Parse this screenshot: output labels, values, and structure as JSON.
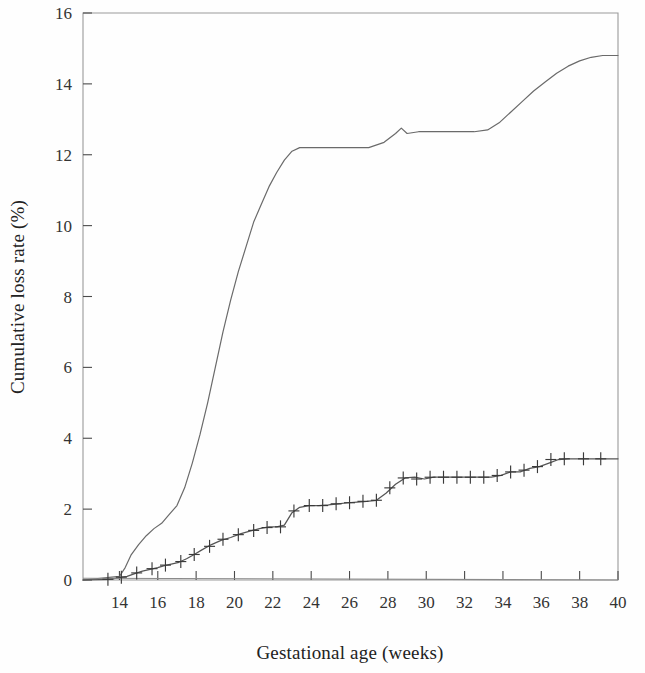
{
  "chart_data": {
    "type": "line",
    "title": "",
    "xlabel": "Gestational age (weeks)",
    "ylabel": "Cumulative loss rate (%)",
    "xlim": [
      12.1,
      40.0
    ],
    "ylim": [
      0,
      16
    ],
    "xticks": [
      14,
      16,
      18,
      20,
      22,
      24,
      26,
      28,
      30,
      32,
      34,
      36,
      38,
      40
    ],
    "yticks": [
      0,
      2,
      4,
      6,
      8,
      10,
      12,
      14,
      16
    ],
    "xtick_labels": [
      "14",
      "16",
      "18",
      "20",
      "22",
      "24",
      "26",
      "28",
      "30",
      "32",
      "34",
      "36",
      "38",
      "40"
    ],
    "ytick_labels": [
      "0",
      "2",
      "4",
      "6",
      "8",
      "10",
      "12",
      "14",
      "16"
    ],
    "grid": false,
    "legend": "none",
    "frame": "top-right-left-bottom-box",
    "series": [
      {
        "name": "upper-curve",
        "style": "plain-line",
        "color": "#6a6a6a",
        "x": [
          12.1,
          13.0,
          13.6,
          14.0,
          14.3,
          14.6,
          15.0,
          15.4,
          15.8,
          16.2,
          16.6,
          17.0,
          17.4,
          17.8,
          18.2,
          18.6,
          19.0,
          19.4,
          19.8,
          20.2,
          20.6,
          21.0,
          21.4,
          21.8,
          22.2,
          22.6,
          23.0,
          23.4,
          24.0,
          25.0,
          26.0,
          27.0,
          27.8,
          28.4,
          28.7,
          29.0,
          29.6,
          30.5,
          31.5,
          32.5,
          33.2,
          33.8,
          34.4,
          35.0,
          35.6,
          36.2,
          36.8,
          37.4,
          38.0,
          38.6,
          39.2,
          40.0
        ],
        "y": [
          0.0,
          0.05,
          0.08,
          0.1,
          0.35,
          0.7,
          1.0,
          1.25,
          1.45,
          1.6,
          1.85,
          2.1,
          2.6,
          3.3,
          4.1,
          5.0,
          6.0,
          7.0,
          7.9,
          8.7,
          9.4,
          10.1,
          10.6,
          11.1,
          11.5,
          11.85,
          12.1,
          12.2,
          12.2,
          12.2,
          12.2,
          12.2,
          12.35,
          12.6,
          12.75,
          12.6,
          12.65,
          12.65,
          12.65,
          12.65,
          12.7,
          12.9,
          13.2,
          13.5,
          13.8,
          14.05,
          14.3,
          14.5,
          14.65,
          14.75,
          14.8,
          14.8
        ]
      },
      {
        "name": "lower-curve",
        "style": "line-with-censor-marks",
        "color": "#555555",
        "x": [
          12.1,
          13.4,
          13.9,
          14.1,
          14.4,
          14.8,
          15.2,
          15.6,
          16.0,
          16.3,
          16.7,
          17.1,
          17.5,
          17.9,
          18.3,
          18.8,
          19.3,
          19.8,
          20.3,
          20.8,
          21.3,
          21.8,
          22.2,
          22.6,
          23.0,
          23.4,
          23.9,
          24.4,
          24.9,
          25.4,
          25.9,
          26.4,
          26.9,
          27.4,
          27.9,
          28.4,
          28.9,
          29.4,
          29.9,
          30.4,
          30.9,
          31.4,
          31.9,
          32.4,
          32.9,
          33.4,
          33.9,
          34.4,
          34.9,
          35.4,
          35.9,
          36.4,
          36.9,
          37.4,
          38.2,
          39.0,
          40.0
        ],
        "y": [
          0.0,
          0.02,
          0.05,
          0.08,
          0.1,
          0.18,
          0.25,
          0.3,
          0.35,
          0.4,
          0.45,
          0.5,
          0.6,
          0.72,
          0.85,
          1.0,
          1.12,
          1.2,
          1.3,
          1.38,
          1.45,
          1.5,
          1.5,
          1.55,
          1.9,
          2.05,
          2.1,
          2.1,
          2.12,
          2.15,
          2.18,
          2.2,
          2.22,
          2.25,
          2.45,
          2.7,
          2.88,
          2.9,
          2.85,
          2.9,
          2.9,
          2.9,
          2.9,
          2.9,
          2.9,
          2.9,
          2.95,
          3.05,
          3.05,
          3.15,
          3.2,
          3.3,
          3.4,
          3.42,
          3.42,
          3.42,
          3.42
        ]
      },
      {
        "name": "baseline-curve",
        "style": "flat-line",
        "color": "#8a8a8a",
        "x": [
          12.1,
          40.0
        ],
        "y": [
          0.05,
          0.0
        ]
      }
    ],
    "censor_marks": {
      "series": "lower-curve",
      "x": [
        13.4,
        14.1,
        14.9,
        15.7,
        16.4,
        17.2,
        17.9,
        18.7,
        19.4,
        20.2,
        21.0,
        21.7,
        22.4,
        23.1,
        23.9,
        24.6,
        25.3,
        26.0,
        26.7,
        27.4,
        28.1,
        28.8,
        29.5,
        30.2,
        30.9,
        31.6,
        32.3,
        33.0,
        33.7,
        34.4,
        35.1,
        35.8,
        36.5,
        37.2,
        38.2,
        39.1
      ],
      "y": [
        0.02,
        0.08,
        0.2,
        0.32,
        0.42,
        0.52,
        0.72,
        0.95,
        1.15,
        1.28,
        1.4,
        1.48,
        1.5,
        1.95,
        2.1,
        2.1,
        2.15,
        2.18,
        2.22,
        2.25,
        2.6,
        2.88,
        2.85,
        2.9,
        2.9,
        2.9,
        2.9,
        2.9,
        2.95,
        3.05,
        3.1,
        3.2,
        3.4,
        3.42,
        3.42,
        3.42
      ]
    }
  }
}
